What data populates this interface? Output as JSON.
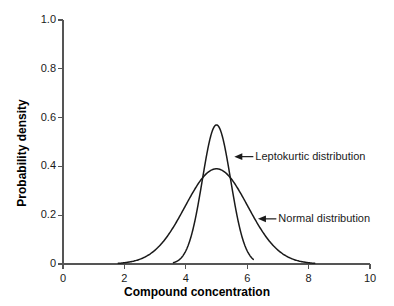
{
  "chart_data": {
    "type": "line",
    "title": "",
    "xlabel": "Compound concentration",
    "ylabel": "Probability density",
    "xlim": [
      0,
      10
    ],
    "ylim": [
      0,
      1.0
    ],
    "xticks": [
      0,
      2,
      4,
      6,
      8,
      10
    ],
    "xtick_labels": [
      "0",
      "2",
      "4",
      "6",
      "8",
      "10"
    ],
    "yticks": [
      0,
      0.2,
      0.4,
      0.6,
      0.8,
      1.0
    ],
    "ytick_labels": [
      "0",
      "0.2",
      "0.4",
      "0.6",
      "0.8",
      "1.0"
    ],
    "grid": false,
    "legend": "none",
    "series": [
      {
        "name": "Normal distribution",
        "peak_x": 5.0,
        "peak_y": 0.39,
        "mean": 5.0,
        "sigma": 1.02,
        "color": "#1a1a1a",
        "x": [
          1.8,
          2.0,
          2.4,
          2.8,
          3.2,
          3.6,
          4.0,
          4.4,
          4.8,
          5.0,
          5.2,
          5.6,
          6.0,
          6.4,
          6.8,
          7.2,
          7.6,
          8.0,
          8.2
        ],
        "values": [
          0.003,
          0.005,
          0.013,
          0.029,
          0.058,
          0.1,
          0.155,
          0.22,
          0.37,
          0.39,
          0.37,
          0.3,
          0.22,
          0.155,
          0.1,
          0.058,
          0.029,
          0.013,
          0.008
        ]
      },
      {
        "name": "Leptokurtic distribution",
        "peak_x": 5.0,
        "peak_y": 0.57,
        "mean": 5.0,
        "sigma": 0.46,
        "color": "#1a1a1a",
        "x": [
          3.6,
          3.8,
          4.0,
          4.2,
          4.4,
          4.6,
          4.8,
          5.0,
          5.2,
          5.4,
          5.6,
          5.8,
          6.0,
          6.2
        ],
        "values": [
          0.004,
          0.012,
          0.04,
          0.12,
          0.26,
          0.43,
          0.54,
          0.57,
          0.54,
          0.43,
          0.26,
          0.1,
          0.025,
          0.006
        ]
      }
    ],
    "annotations": [
      {
        "text": "Leptokurtic distribution",
        "target_x": 5.58,
        "target_y": 0.44,
        "label_x": 6.2,
        "label_y": 0.44
      },
      {
        "text": "Normal distribution",
        "target_x": 6.35,
        "target_y": 0.185,
        "label_x": 6.95,
        "label_y": 0.185
      }
    ],
    "axis_color": "#555555",
    "curve_color": "#1a1a1a",
    "background": "#ffffff"
  }
}
